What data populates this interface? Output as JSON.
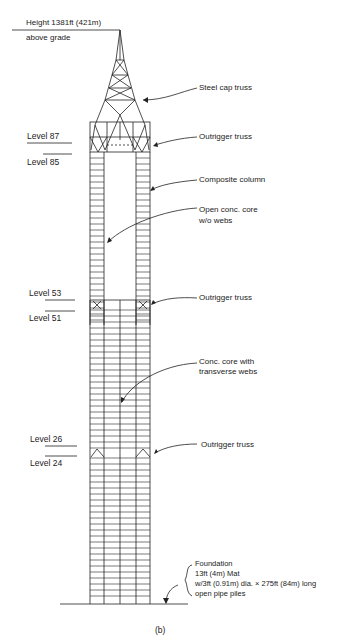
{
  "figure": {
    "caption": "(b)",
    "height_label_line1": "Height 1381ft (421m)",
    "height_label_line2": "above grade"
  },
  "levels": [
    {
      "label": "Level 87"
    },
    {
      "label": "Level 85"
    },
    {
      "label": "Level 53"
    },
    {
      "label": "Level 51"
    },
    {
      "label": "Level 26"
    },
    {
      "label": "Level 24"
    }
  ],
  "annotations": {
    "steel_cap_truss": "Steel cap truss",
    "outrigger_truss_top": "Outrigger truss",
    "composite_column": "Composite column",
    "open_core_line1": "Open conc. core",
    "open_core_line2": "w/o webs",
    "outrigger_truss_mid": "Outrigger truss",
    "conc_core_line1": "Conc. core with",
    "conc_core_line2": "transverse webs",
    "outrigger_truss_low": "Outrigger truss",
    "foundation_line1": "Foundation",
    "foundation_line2": "13ft (4m) Mat",
    "foundation_line3": "w/3ft (0.91m) dia. × 275ft (84m) long",
    "foundation_line4": "open pipe piles"
  }
}
